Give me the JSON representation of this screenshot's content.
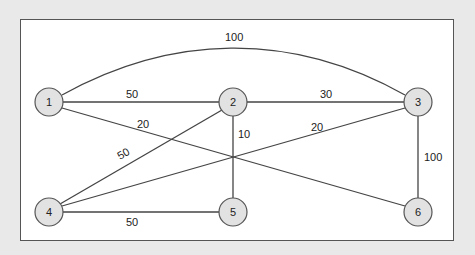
{
  "diagram": {
    "type": "weighted-undirected-graph",
    "nodes": [
      {
        "id": "1",
        "label": "1",
        "x": 49,
        "y": 102
      },
      {
        "id": "2",
        "label": "2",
        "x": 233,
        "y": 102
      },
      {
        "id": "3",
        "label": "3",
        "x": 418,
        "y": 102
      },
      {
        "id": "4",
        "label": "4",
        "x": 49,
        "y": 212
      },
      {
        "id": "5",
        "label": "5",
        "x": 233,
        "y": 212
      },
      {
        "id": "6",
        "label": "6",
        "x": 418,
        "y": 212
      }
    ],
    "edges": [
      {
        "from": "1",
        "to": "3",
        "weight": "100",
        "curved": true
      },
      {
        "from": "1",
        "to": "2",
        "weight": "50"
      },
      {
        "from": "2",
        "to": "3",
        "weight": "30"
      },
      {
        "from": "1",
        "to": "6",
        "weight": "20"
      },
      {
        "from": "2",
        "to": "4",
        "weight": "50"
      },
      {
        "from": "2",
        "to": "5",
        "weight": "10"
      },
      {
        "from": "4",
        "to": "3",
        "weight": "20"
      },
      {
        "from": "3",
        "to": "6",
        "weight": "100"
      },
      {
        "from": "4",
        "to": "5",
        "weight": "50"
      }
    ]
  },
  "colors": {
    "background": "#e9e9e9",
    "panel": "#ffffff",
    "node_fill": "#e2e2e2",
    "stroke": "#444444"
  }
}
